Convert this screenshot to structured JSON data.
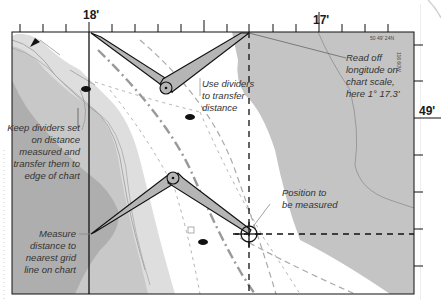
{
  "chart": {
    "top_scale": {
      "major_left_label": "18'",
      "major_right_label": "17'"
    },
    "right_scale": {
      "major_label": "49'"
    },
    "corner_position": {
      "latitude": "50 49' 24N",
      "longitude": "116 60W"
    }
  },
  "annotations": {
    "read_off": [
      "Read off",
      "longitude on",
      "chart scale,",
      "here 1° 17.3'"
    ],
    "use_dividers": [
      "Use dividers",
      "to transfer",
      "distance"
    ],
    "keep_dividers": [
      "Keep dividers set",
      "on distance",
      "measured and",
      "transfer them to",
      "edge of chart"
    ],
    "position": [
      "Position to",
      "be measured"
    ],
    "measure": [
      "Measure",
      "distance to",
      "nearest grid",
      "line on chart"
    ]
  },
  "colors": {
    "land_dark": "#a9a9a9",
    "land_mid": "#c4c4c4",
    "land_light": "#dedede",
    "divider_fill": "#b5b5b5",
    "ink": "#111111"
  }
}
